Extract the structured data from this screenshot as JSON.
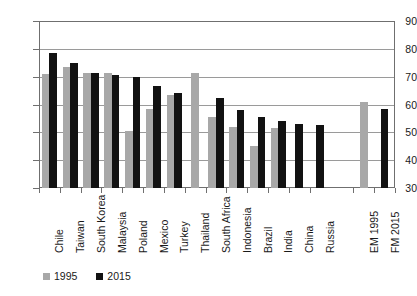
{
  "chart_data": {
    "type": "bar",
    "title": "",
    "subtitle": "",
    "xlabel": "",
    "ylabel": "",
    "ylim": [
      30,
      90
    ],
    "yticks": [
      30,
      40,
      50,
      60,
      70,
      80,
      90
    ],
    "grid": true,
    "legend_position": "bottom-left",
    "categories": [
      "Chile",
      "Taiwan",
      "South Korea",
      "Malaysia",
      "Poland",
      "Mexico",
      "Turkey",
      "Thailand",
      "South Africa",
      "Indonesia",
      "Brazil",
      "India",
      "China",
      "Russia",
      "EM 1995",
      "FM 2015"
    ],
    "series": [
      {
        "name": "1995",
        "color": "#a8a8a8",
        "values": [
          71.0,
          73.5,
          71.5,
          71.5,
          50.5,
          58.5,
          63.5,
          71.5,
          55.5,
          52.0,
          45.0,
          51.5,
          null,
          null,
          61.0,
          null
        ]
      },
      {
        "name": "2015",
        "color": "#121212",
        "values": [
          78.5,
          75.0,
          71.5,
          70.5,
          70.0,
          66.5,
          64.0,
          null,
          62.5,
          58.0,
          55.5,
          54.0,
          53.0,
          52.5,
          null,
          58.5
        ]
      }
    ]
  },
  "legend": {
    "items": [
      {
        "label": "1995"
      },
      {
        "label": "2015"
      }
    ]
  },
  "axis": {
    "y_tick_labels": [
      "90",
      "80",
      "70",
      "60",
      "50",
      "40",
      "30"
    ]
  }
}
